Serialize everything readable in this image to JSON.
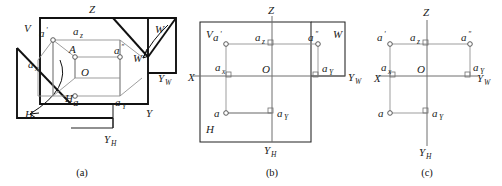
{
  "figure": {
    "captions": [
      {
        "key": "a",
        "text": "(a)",
        "description": "Pictorial view of the three mutually perpendicular projection planes with point A"
      },
      {
        "key": "b",
        "text": "(b)",
        "description": "Planes unfolded into one drawing plane, plane outlines retained"
      },
      {
        "key": "c",
        "text": "(c)",
        "description": "Final projection drawing with plane outlines removed"
      }
    ],
    "colors": {
      "line": "#111111",
      "construction_line": "#8d8d8d",
      "axis": "#6f6f6f",
      "node_fill": "#ffffff",
      "background": "#ffffff"
    }
  },
  "panel_a": {
    "caption": "(a)",
    "plane_labels": [
      {
        "name": "V",
        "text": "V"
      },
      {
        "name": "W-folded",
        "text": "W"
      },
      {
        "name": "W-edge",
        "text": "W"
      },
      {
        "name": "H-edge",
        "text": "H"
      },
      {
        "name": "H-folded",
        "text": "H"
      }
    ],
    "axis_labels": [
      {
        "name": "Z",
        "text": "Z"
      },
      {
        "name": "Y",
        "text": "Y"
      },
      {
        "name": "YW",
        "text": "Y",
        "sub": "W"
      },
      {
        "name": "YH",
        "text": "Y",
        "sub": "H"
      }
    ],
    "points": [
      {
        "name": "A",
        "text": "A"
      },
      {
        "name": "O",
        "text": "O"
      },
      {
        "name": "a-prime",
        "text": "a",
        "sup": "'"
      },
      {
        "name": "a-double-prime",
        "text": "a",
        "sup": "\""
      },
      {
        "name": "a",
        "text": "a"
      },
      {
        "name": "ax",
        "text": "a",
        "sub": "x"
      },
      {
        "name": "ay",
        "text": "a",
        "sub": "Y"
      },
      {
        "name": "az",
        "text": "a",
        "sub": "z"
      }
    ]
  },
  "panel_b": {
    "caption": "(b)",
    "plane_labels": [
      {
        "name": "V",
        "text": "V"
      },
      {
        "name": "W",
        "text": "W"
      },
      {
        "name": "H",
        "text": "H"
      }
    ],
    "axis_labels": [
      {
        "name": "Z",
        "text": "Z"
      },
      {
        "name": "X",
        "text": "X"
      },
      {
        "name": "YW",
        "text": "Y",
        "sub": "W"
      },
      {
        "name": "YH",
        "text": "Y",
        "sub": "H"
      }
    ],
    "points": [
      {
        "name": "a-prime",
        "text": "a",
        "sup": "'"
      },
      {
        "name": "a-double-prime",
        "text": "a",
        "sup": "\""
      },
      {
        "name": "a",
        "text": "a"
      },
      {
        "name": "O",
        "text": "O"
      },
      {
        "name": "ax",
        "text": "a",
        "sub": "x"
      },
      {
        "name": "az",
        "text": "a",
        "sub": "z"
      },
      {
        "name": "ay-right",
        "text": "a",
        "sub": "Y"
      },
      {
        "name": "ay-bottom",
        "text": "a",
        "sub": "Y"
      }
    ]
  },
  "panel_c": {
    "caption": "(c)",
    "axis_labels": [
      {
        "name": "Z",
        "text": "Z"
      },
      {
        "name": "X",
        "text": "X"
      },
      {
        "name": "YW",
        "text": "Y",
        "sub": "W"
      },
      {
        "name": "YH",
        "text": "Y",
        "sub": "H"
      }
    ],
    "points": [
      {
        "name": "a-prime",
        "text": "a",
        "sup": "'"
      },
      {
        "name": "a-double-prime",
        "text": "a",
        "sup": "\""
      },
      {
        "name": "a",
        "text": "a"
      },
      {
        "name": "O",
        "text": "O"
      },
      {
        "name": "ax",
        "text": "a",
        "sub": "x"
      },
      {
        "name": "az",
        "text": "a",
        "sub": "z"
      },
      {
        "name": "ay-right",
        "text": "a",
        "sub": "Y"
      },
      {
        "name": "ay-bottom",
        "text": "a",
        "sub": "Y"
      }
    ]
  }
}
